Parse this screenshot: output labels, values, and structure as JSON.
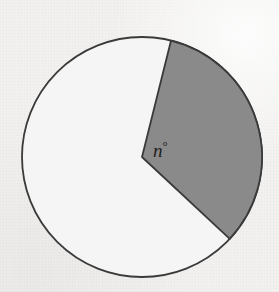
{
  "figure": {
    "name": "circle-with-shaded-sector",
    "caption": "",
    "background_color": "#f2f1ef"
  },
  "circle": {
    "center_x": 142,
    "center_y": 157,
    "radius": 120,
    "fill_color": "#f5f5f5",
    "stroke_color": "#3a3a3a",
    "stroke_width": 1.8
  },
  "sector": {
    "label": "n",
    "degree_symbol": "°",
    "start_angle_deg": 76,
    "end_angle_deg": -43,
    "central_angle_deg": 119,
    "fill_color": "#8a8a8a",
    "stroke_color": "#3a3a3a",
    "stroke_width": 1.8,
    "label_x": 153,
    "label_y": 157
  },
  "chart_data": {
    "type": "pie",
    "title": "",
    "xlabel": "",
    "ylabel": "",
    "categories": [
      "shaded sector",
      "unshaded remainder"
    ],
    "values": [
      119,
      241
    ],
    "value_unit": "degrees",
    "colors": [
      "#8a8a8a",
      "#f5f5f5"
    ],
    "annotations": [
      "n°"
    ],
    "legend": "none",
    "grid": false
  }
}
